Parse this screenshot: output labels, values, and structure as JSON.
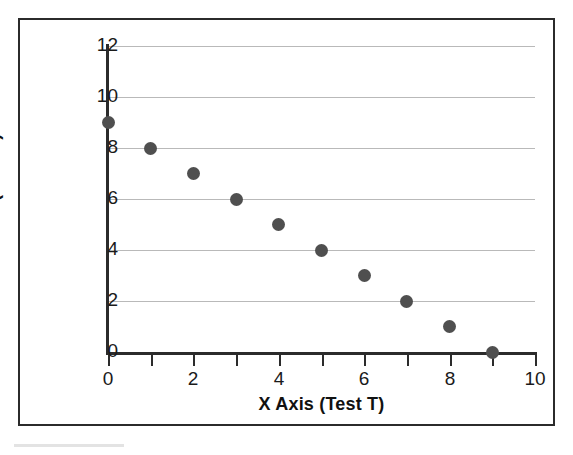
{
  "chart_data": {
    "type": "scatter",
    "title": "",
    "xlabel": "X Axis (Test T)",
    "ylabel": "Y Axis (Test U)",
    "xlim": [
      0,
      10
    ],
    "ylim": [
      0,
      12
    ],
    "x": [
      0,
      1,
      2,
      3,
      4,
      5,
      6,
      7,
      8,
      9
    ],
    "y": [
      9,
      8,
      7,
      6,
      5,
      4,
      3,
      2,
      1,
      0
    ],
    "series": [
      {
        "name": "Test T vs Test U",
        "points": [
          {
            "x": 0,
            "y": 9
          },
          {
            "x": 1,
            "y": 8
          },
          {
            "x": 2,
            "y": 7
          },
          {
            "x": 3,
            "y": 6
          },
          {
            "x": 4,
            "y": 5
          },
          {
            "x": 5,
            "y": 4
          },
          {
            "x": 6,
            "y": 3
          },
          {
            "x": 7,
            "y": 2
          },
          {
            "x": 8,
            "y": 1
          },
          {
            "x": 9,
            "y": 0
          }
        ],
        "marker": "filled-circle",
        "color": "#4f4f4f"
      }
    ],
    "x_tick_labels": [
      "0",
      "2",
      "4",
      "6",
      "8",
      "10"
    ],
    "x_tick_values": [
      0,
      2,
      4,
      6,
      8,
      10
    ],
    "x_minor_ticks": [
      0,
      1,
      2,
      3,
      4,
      5,
      6,
      7,
      8,
      9,
      10
    ],
    "y_tick_labels": [
      "0",
      "2",
      "4",
      "6",
      "8",
      "10",
      "12"
    ],
    "y_tick_values": [
      0,
      2,
      4,
      6,
      8,
      10,
      12
    ],
    "gridlines": "horizontal",
    "grid_color": "#b9b9b9",
    "axis_color": "#2b2b2b",
    "legend": "none",
    "background": "#ffffff"
  }
}
